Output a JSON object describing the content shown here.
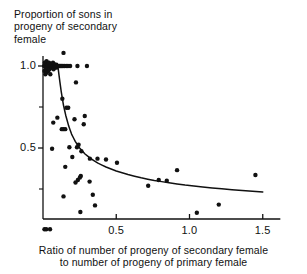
{
  "figure": {
    "background_color": "#ffffff",
    "ink_color": "#111111"
  },
  "axis_titles": {
    "y_title": "Proportion of sons in\nprogeny of secondary\nfemale",
    "x_title": "Ratio of number of progeny of secondary female\nto number of progeny of primary female"
  },
  "ticks": {
    "y_labels": [
      "1.0",
      "0.5"
    ],
    "x_labels": [
      "0.5",
      "1.0",
      "1.5"
    ]
  },
  "chart_data": {
    "type": "scatter",
    "title": "",
    "xlabel": "Ratio of number of progeny of secondary female to number of progeny of primary female",
    "ylabel": "Proportion of sons in progeny of secondary female",
    "xlim": [
      0.0,
      1.62
    ],
    "ylim": [
      -0.04,
      1.14
    ],
    "xticks": [
      0.5,
      1.0,
      1.5
    ],
    "yticks": [
      0.5,
      1.0
    ],
    "yminor_ticks": [
      0.25,
      0.75
    ],
    "grid": false,
    "legend": null,
    "marker": {
      "shape": "circle",
      "color": "#111111",
      "size_px": 3.4
    },
    "points": [
      {
        "x": 0.008,
        "y": 1.0
      },
      {
        "x": 0.01,
        "y": 0.97
      },
      {
        "x": 0.012,
        "y": 1.02
      },
      {
        "x": 0.014,
        "y": 1.0
      },
      {
        "x": 0.016,
        "y": 0.95
      },
      {
        "x": 0.018,
        "y": 1.01
      },
      {
        "x": 0.02,
        "y": 0.98
      },
      {
        "x": 0.022,
        "y": 1.0
      },
      {
        "x": 0.024,
        "y": 1.03
      },
      {
        "x": 0.026,
        "y": 0.96
      },
      {
        "x": 0.028,
        "y": 1.0
      },
      {
        "x": 0.03,
        "y": 0.99
      },
      {
        "x": 0.033,
        "y": 1.01
      },
      {
        "x": 0.036,
        "y": 0.97
      },
      {
        "x": 0.038,
        "y": 1.0
      },
      {
        "x": 0.041,
        "y": 1.02
      },
      {
        "x": 0.044,
        "y": 0.98
      },
      {
        "x": 0.047,
        "y": 1.0
      },
      {
        "x": 0.05,
        "y": 0.95
      },
      {
        "x": 0.053,
        "y": 1.0
      },
      {
        "x": 0.056,
        "y": 1.01
      },
      {
        "x": 0.06,
        "y": 0.99
      },
      {
        "x": 0.064,
        "y": 1.0
      },
      {
        "x": 0.068,
        "y": 1.02
      },
      {
        "x": 0.072,
        "y": 0.98
      },
      {
        "x": 0.076,
        "y": 1.0
      },
      {
        "x": 0.08,
        "y": 1.0
      },
      {
        "x": 0.085,
        "y": 1.01
      },
      {
        "x": 0.09,
        "y": 0.99
      },
      {
        "x": 0.095,
        "y": 1.0
      },
      {
        "x": 0.1,
        "y": 1.0
      },
      {
        "x": 0.106,
        "y": 1.0
      },
      {
        "x": 0.112,
        "y": 1.0
      },
      {
        "x": 0.12,
        "y": 1.0
      },
      {
        "x": 0.128,
        "y": 1.0
      },
      {
        "x": 0.136,
        "y": 1.0
      },
      {
        "x": 0.145,
        "y": 1.0
      },
      {
        "x": 0.158,
        "y": 1.0
      },
      {
        "x": 0.17,
        "y": 1.0
      },
      {
        "x": 0.185,
        "y": 1.0
      },
      {
        "x": 0.14,
        "y": 1.08
      },
      {
        "x": 0.235,
        "y": 1.0
      },
      {
        "x": 0.3,
        "y": 1.0
      },
      {
        "x": 0.225,
        "y": 0.9
      },
      {
        "x": 0.132,
        "y": 0.8
      },
      {
        "x": 0.16,
        "y": 0.745
      },
      {
        "x": 0.172,
        "y": 0.745
      },
      {
        "x": 0.098,
        "y": 0.685
      },
      {
        "x": 0.07,
        "y": 0.655
      },
      {
        "x": 0.215,
        "y": 0.675
      },
      {
        "x": 0.285,
        "y": 0.695
      },
      {
        "x": 0.278,
        "y": 0.645
      },
      {
        "x": 0.128,
        "y": 0.615
      },
      {
        "x": 0.14,
        "y": 0.615
      },
      {
        "x": 0.152,
        "y": 0.615
      },
      {
        "x": 0.062,
        "y": 0.495
      },
      {
        "x": 0.18,
        "y": 0.505
      },
      {
        "x": 0.232,
        "y": 0.505
      },
      {
        "x": 0.243,
        "y": 0.52
      },
      {
        "x": 0.2,
        "y": 0.445
      },
      {
        "x": 0.262,
        "y": 0.48
      },
      {
        "x": 0.32,
        "y": 0.435
      },
      {
        "x": 0.372,
        "y": 0.435
      },
      {
        "x": 0.43,
        "y": 0.43
      },
      {
        "x": 0.505,
        "y": 0.41
      },
      {
        "x": 0.152,
        "y": 0.385
      },
      {
        "x": 0.915,
        "y": 0.365
      },
      {
        "x": 1.45,
        "y": 0.335
      },
      {
        "x": 0.238,
        "y": 0.305
      },
      {
        "x": 0.252,
        "y": 0.32
      },
      {
        "x": 0.258,
        "y": 0.33
      },
      {
        "x": 0.222,
        "y": 0.29
      },
      {
        "x": 0.318,
        "y": 0.295
      },
      {
        "x": 0.79,
        "y": 0.305
      },
      {
        "x": 0.845,
        "y": 0.3
      },
      {
        "x": 0.718,
        "y": 0.27
      },
      {
        "x": 0.14,
        "y": 0.205
      },
      {
        "x": 0.34,
        "y": 0.215
      },
      {
        "x": 1.2,
        "y": 0.155
      },
      {
        "x": 0.355,
        "y": 0.15
      },
      {
        "x": 0.255,
        "y": 0.11
      },
      {
        "x": 1.05,
        "y": 0.105
      },
      {
        "x": 0.01,
        "y": 0.005
      },
      {
        "x": 0.022,
        "y": 0.005
      },
      {
        "x": 0.048,
        "y": 0.005
      }
    ],
    "fitted_curve": {
      "label": "fitted decay curve",
      "color": "#111111",
      "points": [
        {
          "x": 0.098,
          "y": 1.015
        },
        {
          "x": 0.105,
          "y": 0.975
        },
        {
          "x": 0.115,
          "y": 0.905
        },
        {
          "x": 0.125,
          "y": 0.84
        },
        {
          "x": 0.14,
          "y": 0.76
        },
        {
          "x": 0.155,
          "y": 0.7
        },
        {
          "x": 0.175,
          "y": 0.635
        },
        {
          "x": 0.195,
          "y": 0.585
        },
        {
          "x": 0.22,
          "y": 0.54
        },
        {
          "x": 0.25,
          "y": 0.5
        },
        {
          "x": 0.285,
          "y": 0.465
        },
        {
          "x": 0.325,
          "y": 0.436
        },
        {
          "x": 0.375,
          "y": 0.408
        },
        {
          "x": 0.43,
          "y": 0.384
        },
        {
          "x": 0.5,
          "y": 0.36
        },
        {
          "x": 0.58,
          "y": 0.338
        },
        {
          "x": 0.67,
          "y": 0.318
        },
        {
          "x": 0.76,
          "y": 0.302
        },
        {
          "x": 0.86,
          "y": 0.288
        },
        {
          "x": 0.97,
          "y": 0.274
        },
        {
          "x": 1.09,
          "y": 0.262
        },
        {
          "x": 1.22,
          "y": 0.251
        },
        {
          "x": 1.36,
          "y": 0.241
        },
        {
          "x": 1.5,
          "y": 0.232
        }
      ]
    }
  }
}
